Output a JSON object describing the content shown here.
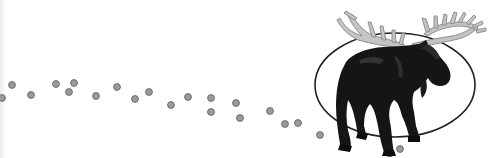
{
  "scene": {
    "description": "Clip-art moose inside an oval with a trail of grey hoof-print dots leading from the left",
    "background_color": "#ffffff",
    "dot_color": "#9a9a9a",
    "dot_stroke": "#6e6e6e",
    "moose_color": "#151515",
    "antler_color": "#c4c4c4",
    "antler_stroke": "#8f8f8f",
    "ellipse_stroke": "#222222"
  },
  "oval": {
    "cx": 395,
    "cy": 85,
    "rx": 80,
    "ry": 52
  },
  "trail": [
    {
      "x": 2,
      "y": 98
    },
    {
      "x": 12,
      "y": 85
    },
    {
      "x": 31,
      "y": 95
    },
    {
      "x": 56,
      "y": 84
    },
    {
      "x": 69,
      "y": 92
    },
    {
      "x": 74,
      "y": 83
    },
    {
      "x": 96,
      "y": 96
    },
    {
      "x": 117,
      "y": 87
    },
    {
      "x": 135,
      "y": 99
    },
    {
      "x": 149,
      "y": 92
    },
    {
      "x": 171,
      "y": 105
    },
    {
      "x": 188,
      "y": 97
    },
    {
      "x": 211,
      "y": 98
    },
    {
      "x": 211,
      "y": 112
    },
    {
      "x": 236,
      "y": 103
    },
    {
      "x": 240,
      "y": 118
    },
    {
      "x": 270,
      "y": 111
    },
    {
      "x": 285,
      "y": 124
    },
    {
      "x": 298,
      "y": 123
    },
    {
      "x": 320,
      "y": 135
    },
    {
      "x": 400,
      "y": 149
    }
  ]
}
